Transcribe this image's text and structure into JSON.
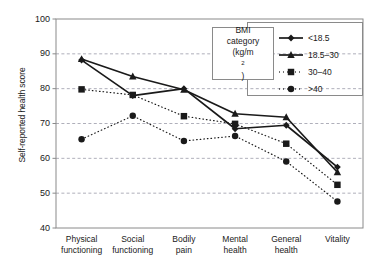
{
  "chart_data": {
    "type": "line",
    "title": "",
    "xlabel": "",
    "ylabel": "Self-reported health score",
    "ylim": [
      40,
      100
    ],
    "yticks": [
      40,
      50,
      60,
      70,
      80,
      90,
      100
    ],
    "grid": "horizontal dashed gridlines at 50, 60, 70, 80, 90",
    "legend_position": "top-right",
    "legend_title": "BMI category (kg/m2)",
    "categories": [
      "Physical functioning",
      "Social functioning",
      "Bodily pain",
      "Mental health",
      "General health",
      "Vitality"
    ],
    "series": [
      {
        "name": "<18.5",
        "marker": "diamond",
        "linestyle": "solid",
        "color": "#1a1a1a",
        "values": [
          88.2,
          78.0,
          80.0,
          68.5,
          69.5,
          57.5
        ]
      },
      {
        "name": "18.5–30",
        "marker": "triangle",
        "linestyle": "solid",
        "color": "#1a1a1a",
        "values": [
          88.5,
          83.5,
          79.7,
          72.8,
          71.8,
          56.0
        ]
      },
      {
        "name": "30–40",
        "marker": "square",
        "linestyle": "dotted",
        "color": "#1a1a1a",
        "values": [
          79.8,
          78.2,
          72.1,
          69.9,
          64.2,
          52.4
        ]
      },
      {
        "name": ">40",
        "marker": "circle",
        "linestyle": "dotted",
        "color": "#1a1a1a",
        "values": [
          65.5,
          72.2,
          65.0,
          66.4,
          59.1,
          47.6
        ]
      }
    ]
  },
  "axis": {
    "y_title": "Self-reported health score",
    "y_ticks": [
      "100",
      "90",
      "80",
      "70",
      "60",
      "50",
      "40"
    ],
    "x_labels": [
      {
        "line1": "Physical",
        "line2": "functioning"
      },
      {
        "line1": "Social",
        "line2": "functioning"
      },
      {
        "line1": "Bodily",
        "line2": "pain"
      },
      {
        "line1": "Mental",
        "line2": "health"
      },
      {
        "line1": "General",
        "line2": "health"
      },
      {
        "line1": "Vitality",
        "line2": ""
      }
    ]
  },
  "legend": {
    "title_line1": "BMI",
    "title_line2": "category",
    "title_line3_pre": "(kg/m",
    "title_line3_sup": "2",
    "title_line3_post": ")",
    "entries": [
      {
        "label": "<18.5"
      },
      {
        "label": "18.5–30"
      },
      {
        "label": "30–40"
      },
      {
        "label": ">40"
      }
    ]
  },
  "style": {
    "ink": "#1a1a1a",
    "grid": "#9a9aa8",
    "frame": "#8a8a8a"
  }
}
